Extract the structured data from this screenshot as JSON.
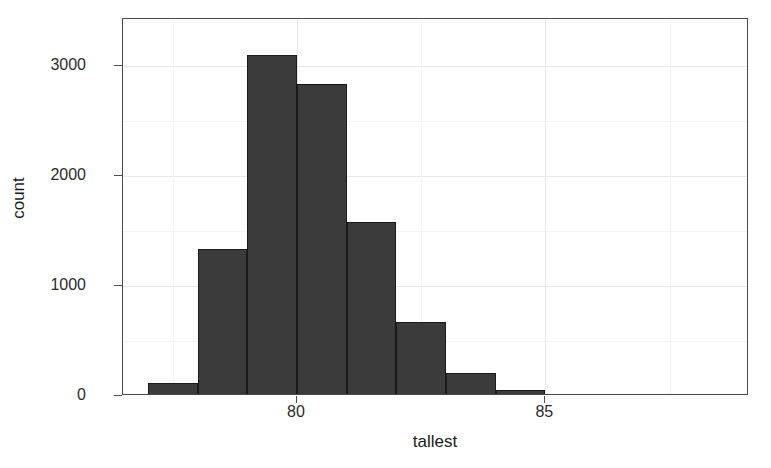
{
  "chart_data": {
    "type": "bar",
    "title": "",
    "subtitle": "",
    "xlabel": "tallest",
    "ylabel": "count",
    "xlim": [
      76.5,
      89.1
    ],
    "ylim": [
      0,
      3430
    ],
    "grid": true,
    "legend": null,
    "bin_width": 1,
    "bar_color": "#3b3b3b",
    "bar_border_color": "#1a1a1a",
    "panel_background": "#ffffff",
    "gridline_color": "#e8e8e8",
    "x_ticks": [
      {
        "value": 80,
        "label": "80"
      },
      {
        "value": 85,
        "label": "85"
      }
    ],
    "x_minor_ticks": [
      77.5,
      82.5,
      87.5
    ],
    "y_ticks": [
      {
        "value": 0,
        "label": "0"
      },
      {
        "value": 1000,
        "label": "1000"
      },
      {
        "value": 2000,
        "label": "2000"
      },
      {
        "value": 3000,
        "label": "3000"
      }
    ],
    "y_minor_ticks": [
      500,
      1500,
      2500
    ],
    "bins": [
      {
        "x_start": 77.0,
        "x_end": 78.0,
        "center": 77.5,
        "count": 120
      },
      {
        "x_start": 78.0,
        "x_end": 79.0,
        "center": 78.5,
        "count": 1340
      },
      {
        "x_start": 79.0,
        "x_end": 80.0,
        "center": 79.5,
        "count": 3105
      },
      {
        "x_start": 80.0,
        "x_end": 81.0,
        "center": 80.5,
        "count": 2840
      },
      {
        "x_start": 81.0,
        "x_end": 82.0,
        "center": 81.5,
        "count": 1580
      },
      {
        "x_start": 82.0,
        "x_end": 83.0,
        "center": 82.5,
        "count": 670
      },
      {
        "x_start": 83.0,
        "x_end": 84.0,
        "center": 83.5,
        "count": 210
      },
      {
        "x_start": 84.0,
        "x_end": 85.0,
        "center": 84.5,
        "count": 55
      },
      {
        "x_start": 85.0,
        "x_end": 86.0,
        "center": 85.5,
        "count": 20
      }
    ],
    "categories": [
      "77.5",
      "78.5",
      "79.5",
      "80.5",
      "81.5",
      "82.5",
      "83.5",
      "84.5",
      "85.5"
    ],
    "values": [
      120,
      1340,
      3105,
      2840,
      1580,
      670,
      210,
      55,
      20
    ]
  }
}
